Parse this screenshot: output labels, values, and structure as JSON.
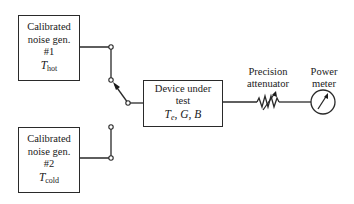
{
  "diagram": {
    "type": "noise-figure-measurement-setup",
    "colors": {
      "stroke": "#2a2a2a",
      "background": "#ffffff"
    },
    "sources": [
      {
        "id": "gen1",
        "line1": "Calibrated",
        "line2": "noise gen.",
        "line3": "#1",
        "temp_symbol": "T",
        "temp_subscript": "hot"
      },
      {
        "id": "gen2",
        "line1": "Calibrated",
        "line2": "noise gen.",
        "line3": "#2",
        "temp_symbol": "T",
        "temp_subscript": "cold"
      }
    ],
    "switch": {
      "position": "gen1"
    },
    "dut": {
      "line1": "Device under",
      "line2": "test",
      "param_symbol": "T",
      "param_subscript": "e",
      "param_rest": ", G, B"
    },
    "attenuator": {
      "line1": "Precision",
      "line2": "attenuator"
    },
    "meter": {
      "line1": "Power",
      "line2": "meter"
    }
  }
}
